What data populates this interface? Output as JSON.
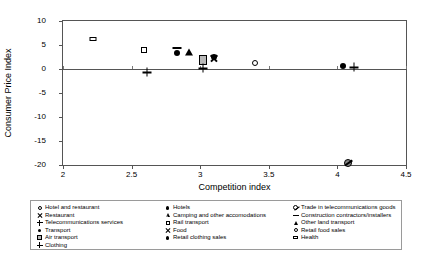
{
  "chart_data": {
    "type": "scatter",
    "title": "",
    "xlabel": "Competition index",
    "ylabel": "Consumer Price Index",
    "xlim": [
      2,
      4.5
    ],
    "ylim": [
      -20,
      10
    ],
    "xticks": [
      "2",
      "2.5",
      "3",
      "3.5",
      "4",
      "4.5"
    ],
    "yticks": [
      "10",
      "5",
      "0",
      "-5",
      "-10",
      "-15",
      "-20"
    ],
    "grid": false,
    "legend_position": "below-plot",
    "points": [
      {
        "label": "Health",
        "marker": "flat-rect",
        "x": 2.22,
        "y": 6.3
      },
      {
        "label": "Air transport",
        "marker": "open-square",
        "x": 2.59,
        "y": 3.9
      },
      {
        "label": "Telecommunications services",
        "marker": "plus",
        "x": 2.61,
        "y": -0.7
      },
      {
        "label": "Construction contractors/installers",
        "marker": "dash",
        "x": 2.83,
        "y": 4.3
      },
      {
        "label": "Transport",
        "marker": "filled-circle",
        "x": 2.83,
        "y": 3.4
      },
      {
        "label": "Other land transport",
        "marker": "filled-tri",
        "x": 2.92,
        "y": 3.5
      },
      {
        "label": "Camping and other accomodations",
        "marker": "open-tri",
        "x": 3.02,
        "y": 3.4
      },
      {
        "label": "Rail transport",
        "marker": "grey-square",
        "x": 3.02,
        "y": 1.8
      },
      {
        "label": "Clothing",
        "marker": "plus-small",
        "x": 3.02,
        "y": 0.2
      },
      {
        "label": "Restaurant",
        "marker": "cross",
        "x": 3.1,
        "y": 2.2
      },
      {
        "label": "Hotels",
        "marker": "filled-dot",
        "x": 3.1,
        "y": 2.4
      },
      {
        "label": "Retail food sales",
        "marker": "open-circle",
        "x": 3.4,
        "y": 1.3
      },
      {
        "label": "Retail clothing sales",
        "marker": "filled-circle",
        "x": 4.04,
        "y": 0.6
      },
      {
        "label": "Food",
        "marker": "plus",
        "x": 4.12,
        "y": 0.4
      },
      {
        "label": "Trade in telecommunications goods",
        "marker": "circle-slash",
        "x": 4.08,
        "y": -18.2
      }
    ]
  },
  "legend": {
    "columns": [
      {
        "items": [
          {
            "marker": "open-circle",
            "label": "Hotel and restaurant"
          },
          {
            "marker": "cross",
            "label": "Restaurant"
          },
          {
            "marker": "plus",
            "label": "Telecommunications services"
          },
          {
            "marker": "filled-circle",
            "label": "Transport"
          },
          {
            "marker": "grey-square",
            "label": "Air transport"
          },
          {
            "marker": "plus",
            "label": "Clothing"
          }
        ]
      },
      {
        "items": [
          {
            "marker": "filled-circle",
            "label": "Hotels"
          },
          {
            "marker": "open-tri",
            "label": "Camping and other accomodations"
          },
          {
            "marker": "open-square",
            "label": "Rail transport"
          },
          {
            "marker": "cross",
            "label": "Food"
          },
          {
            "marker": "filled-circle",
            "label": "Retail clothing sales"
          }
        ]
      },
      {
        "items": [
          {
            "marker": "circle-slash",
            "label": "Trade in telecommunications goods"
          },
          {
            "marker": "dash",
            "label": "Construction contractors/installers"
          },
          {
            "marker": "filled-tri",
            "label": "Other land transport"
          },
          {
            "marker": "open-circle",
            "label": "Retail food sales"
          },
          {
            "marker": "flat-rect",
            "label": "Health"
          }
        ]
      }
    ]
  },
  "colors": {
    "axis": "#555555",
    "marker": "#000000",
    "grey_fill": "#b9b9b9",
    "legend_border": "#9a9a9a",
    "background": "#ffffff"
  }
}
